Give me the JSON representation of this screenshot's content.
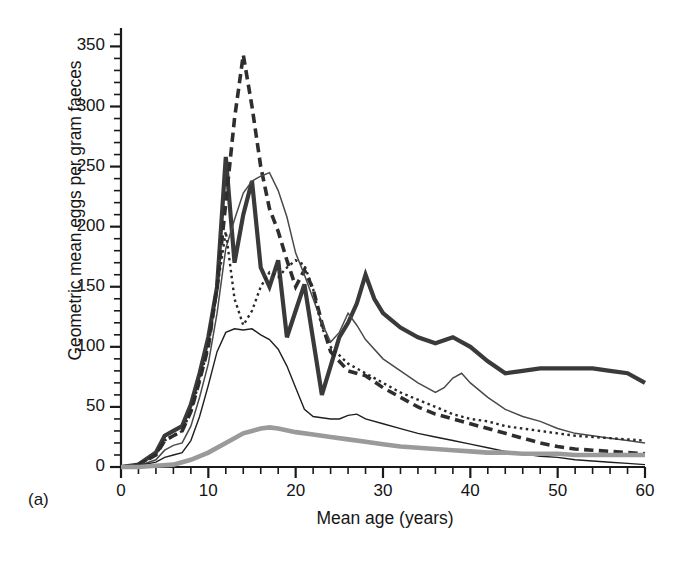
{
  "figure": {
    "panel_label": "(a)",
    "background": "#ffffff",
    "ink_color": "#1a1a1a"
  },
  "chart_data": {
    "type": "line",
    "title": "",
    "subtitle": "",
    "xlabel": "Mean age (years)",
    "ylabel": "Geometric mean eggs per gram faeces",
    "xlim": [
      0,
      60
    ],
    "ylim": [
      0,
      362
    ],
    "xticks": [
      0,
      10,
      20,
      30,
      40,
      50,
      60
    ],
    "xtick_labels": [
      "0",
      "10",
      "20",
      "30",
      "40",
      "50",
      "60"
    ],
    "x_minor_tick_step": 2,
    "yticks": [
      0,
      50,
      100,
      150,
      200,
      250,
      300,
      350
    ],
    "ytick_labels": [
      "0",
      "50",
      "100",
      "150",
      "200",
      "250",
      "300",
      "350"
    ],
    "y_minor_tick_step": 10,
    "grid": false,
    "legend": null,
    "legend_position": "none",
    "annotations": [
      "(a)"
    ],
    "series": [
      {
        "name": "thick-solid-dark",
        "style": "solid",
        "color": "#3a3a3a",
        "width": 4.2,
        "x": [
          0,
          2,
          4,
          5,
          6,
          7,
          8,
          9,
          10,
          11,
          12,
          13,
          14,
          15,
          16,
          17,
          18,
          19,
          20,
          21,
          22,
          23,
          24,
          25,
          26,
          27,
          28,
          29,
          30,
          31,
          32,
          34,
          36,
          38,
          40,
          42,
          44,
          46,
          48,
          50,
          52,
          54,
          56,
          58,
          60
        ],
        "values": [
          0,
          2,
          12,
          26,
          30,
          34,
          52,
          78,
          108,
          150,
          258,
          170,
          210,
          238,
          166,
          150,
          172,
          108,
          130,
          152,
          106,
          60,
          84,
          108,
          120,
          136,
          160,
          140,
          128,
          122,
          116,
          108,
          103,
          108,
          100,
          88,
          78,
          80,
          82,
          82,
          82,
          82,
          80,
          78,
          70
        ]
      },
      {
        "name": "heavy-dashed",
        "style": "dashed",
        "color": "#2e2e2e",
        "width": 3.6,
        "x": [
          0,
          2,
          4,
          5,
          6,
          7,
          8,
          9,
          10,
          11,
          12,
          13,
          14,
          15,
          16,
          17,
          18,
          19,
          20,
          21,
          22,
          23,
          24,
          26,
          28,
          30,
          32,
          34,
          36,
          38,
          40,
          42,
          44,
          46,
          48,
          50,
          52,
          54,
          56,
          58,
          60
        ],
        "values": [
          0,
          2,
          10,
          22,
          26,
          30,
          46,
          72,
          100,
          150,
          220,
          290,
          343,
          300,
          250,
          215,
          196,
          172,
          150,
          164,
          148,
          120,
          96,
          80,
          76,
          66,
          58,
          50,
          44,
          40,
          36,
          32,
          28,
          24,
          20,
          17,
          15,
          14,
          13,
          12,
          11
        ]
      },
      {
        "name": "thin-solid-upper",
        "style": "solid",
        "color": "#4a4a4a",
        "width": 1.5,
        "x": [
          0,
          2,
          4,
          5,
          6,
          7,
          8,
          9,
          10,
          11,
          12,
          13,
          14,
          15,
          16,
          17,
          18,
          19,
          20,
          21,
          22,
          23,
          24,
          25,
          26,
          27,
          28,
          30,
          32,
          34,
          36,
          37,
          38,
          39,
          40,
          42,
          44,
          46,
          48,
          50,
          52,
          54,
          56,
          58,
          60
        ],
        "values": [
          0,
          1,
          6,
          14,
          18,
          20,
          34,
          58,
          86,
          128,
          182,
          206,
          228,
          238,
          242,
          245,
          230,
          208,
          178,
          160,
          140,
          120,
          104,
          112,
          128,
          118,
          106,
          90,
          80,
          70,
          62,
          66,
          74,
          78,
          70,
          58,
          48,
          42,
          38,
          32,
          28,
          26,
          24,
          22,
          20
        ]
      },
      {
        "name": "fine-dotted",
        "style": "dotted",
        "color": "#2a2a2a",
        "width": 2.4,
        "x": [
          0,
          2,
          4,
          5,
          6,
          7,
          8,
          9,
          10,
          11,
          12,
          13,
          14,
          15,
          16,
          17,
          18,
          19,
          20,
          21,
          22,
          23,
          24,
          26,
          28,
          30,
          32,
          34,
          36,
          38,
          40,
          42,
          44,
          46,
          48,
          50,
          52,
          54,
          56,
          58,
          60
        ],
        "values": [
          0,
          2,
          10,
          22,
          26,
          30,
          46,
          72,
          100,
          148,
          196,
          140,
          118,
          130,
          150,
          162,
          158,
          166,
          172,
          168,
          148,
          116,
          100,
          86,
          78,
          70,
          62,
          56,
          50,
          44,
          40,
          38,
          34,
          32,
          30,
          28,
          26,
          25,
          24,
          23,
          22
        ]
      },
      {
        "name": "thin-solid-lower",
        "style": "solid",
        "color": "#1f1f1f",
        "width": 1.4,
        "x": [
          0,
          2,
          4,
          5,
          6,
          7,
          8,
          9,
          10,
          11,
          12,
          13,
          14,
          15,
          16,
          17,
          18,
          19,
          20,
          21,
          22,
          24,
          25,
          26,
          27,
          28,
          30,
          32,
          34,
          36,
          38,
          40,
          42,
          44,
          46,
          48,
          50,
          52,
          54,
          56,
          58,
          60
        ],
        "values": [
          0,
          1,
          4,
          8,
          10,
          12,
          22,
          42,
          68,
          96,
          112,
          115,
          114,
          115,
          110,
          106,
          98,
          84,
          66,
          48,
          42,
          40,
          40,
          43,
          44,
          40,
          36,
          32,
          28,
          25,
          22,
          19,
          16,
          13,
          11,
          9,
          8,
          6,
          5,
          4,
          3,
          2
        ]
      },
      {
        "name": "thick-grey",
        "style": "solid",
        "color": "#9a9a9a",
        "width": 4.6,
        "x": [
          0,
          2,
          4,
          6,
          8,
          10,
          12,
          14,
          15,
          16,
          17,
          18,
          20,
          22,
          24,
          26,
          28,
          30,
          32,
          34,
          36,
          38,
          40,
          42,
          44,
          46,
          48,
          50,
          52,
          54,
          56,
          58,
          60
        ],
        "values": [
          0,
          0,
          1,
          2,
          6,
          12,
          20,
          28,
          30,
          32,
          33,
          32,
          29,
          27,
          25,
          23,
          21,
          19,
          17,
          16,
          15,
          14,
          13,
          12,
          12,
          11,
          11,
          11,
          10,
          10,
          10,
          10,
          10
        ]
      }
    ]
  }
}
